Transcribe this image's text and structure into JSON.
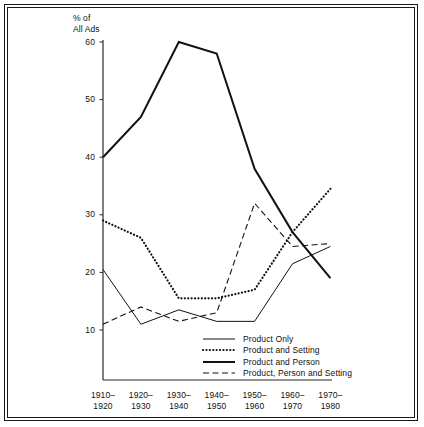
{
  "figure": {
    "y_axis_title_line1": "% of",
    "y_axis_title_line2": "All Ads"
  },
  "chart_data": {
    "type": "line",
    "title": "",
    "xlabel": "",
    "ylabel": "% of All Ads",
    "categories": [
      "1910–\n1920",
      "1920–\n1930",
      "1930–\n1940",
      "1940–\n1950",
      "1950–\n1960",
      "1960–\n1970",
      "1970–\n1980"
    ],
    "category_labels": [
      {
        "line1": "1910–",
        "line2": "1920"
      },
      {
        "line1": "1920–",
        "line2": "1930"
      },
      {
        "line1": "1930–",
        "line2": "1940"
      },
      {
        "line1": "1940–",
        "line2": "1950"
      },
      {
        "line1": "1950–",
        "line2": "1960"
      },
      {
        "line1": "1960–",
        "line2": "1970"
      },
      {
        "line1": "1970–",
        "line2": "1980"
      }
    ],
    "ylim": [
      0,
      60
    ],
    "yticks": [
      10,
      20,
      30,
      40,
      50,
      60
    ],
    "ytick_labels": [
      "10",
      "20",
      "30",
      "40",
      "50",
      "60"
    ],
    "grid": false,
    "legend_position": "inside-bottom-center",
    "series": [
      {
        "name": "Product Only",
        "style": "solid-thin",
        "color": "#111111",
        "values": [
          20.5,
          11.0,
          13.5,
          11.5,
          11.5,
          21.5,
          24.5
        ]
      },
      {
        "name": "Product and Setting",
        "style": "dotted",
        "color": "#111111",
        "values": [
          29.0,
          26.0,
          15.5,
          15.5,
          17.0,
          27.0,
          34.5
        ]
      },
      {
        "name": "Product and Person",
        "style": "solid-thick",
        "color": "#111111",
        "values": [
          40.0,
          47.0,
          60.0,
          58.0,
          38.0,
          27.0,
          19.0
        ]
      },
      {
        "name": "Product, Person and Setting",
        "style": "dashed",
        "color": "#111111",
        "values": [
          11.0,
          14.0,
          11.5,
          13.0,
          32.0,
          24.5,
          25.0
        ]
      }
    ]
  },
  "legend": {
    "items": [
      {
        "label": "Product Only",
        "style": "solid-thin"
      },
      {
        "label": "Product and Setting",
        "style": "dotted"
      },
      {
        "label": "Product and Person",
        "style": "solid-thick"
      },
      {
        "label": "Product, Person and Setting",
        "style": "dashed"
      }
    ]
  }
}
